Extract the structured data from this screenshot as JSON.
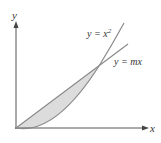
{
  "diagram": {
    "type": "region-between-curves",
    "axes": {
      "x_label": "x",
      "y_label": "y"
    },
    "curves": [
      {
        "name": "parabola",
        "label": "y = x",
        "exponent": "2"
      },
      {
        "name": "line",
        "label": "y = mx"
      }
    ],
    "shaded_region": "area between y = mx and y = x^2 from origin to intersection",
    "colors": {
      "axis": "#555555",
      "curve": "#8a8a8a",
      "fill": "#dcdcdc",
      "text": "#333333"
    }
  }
}
